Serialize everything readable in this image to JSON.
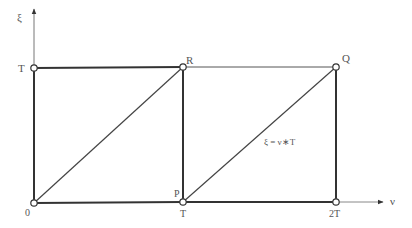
{
  "diagram": {
    "type": "spacetime-diagram",
    "axes": {
      "vertical": {
        "label": "ξ"
      },
      "horizontal": {
        "label": "ν"
      }
    },
    "points": {
      "origin": {
        "label": "0"
      },
      "t_axis": {
        "label": "T"
      },
      "R": {
        "label": "R"
      },
      "Q": {
        "label": "Q"
      },
      "P": {
        "label": "P"
      },
      "P_tick": {
        "label": "T"
      },
      "two_T": {
        "label": "2T"
      }
    },
    "annotation": {
      "label": "ξ = ν∗T"
    },
    "colors": {
      "line": "#333333",
      "thin_line": "#666666",
      "text": "#555555",
      "background": "#ffffff"
    }
  }
}
